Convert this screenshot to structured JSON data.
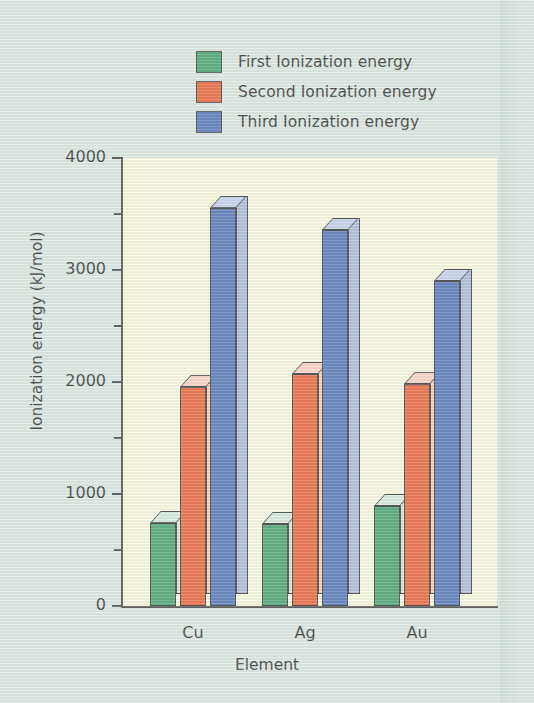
{
  "chart_data": {
    "type": "bar",
    "title": "",
    "xlabel": "Element",
    "ylabel": "Ionization energy (kJ/mol)",
    "categories": [
      "Cu",
      "Ag",
      "Au"
    ],
    "ylim": [
      0,
      4000
    ],
    "ytick_labels": [
      "0",
      "1000",
      "2000",
      "3000",
      "4000"
    ],
    "ytick_values": [
      0,
      1000,
      2000,
      3000,
      4000
    ],
    "yminor_ticks": [
      500,
      1500,
      2500,
      3500
    ],
    "grid": false,
    "legend_position": "top-center",
    "series": [
      {
        "name": "First Ionization energy",
        "color": "#3c9b66",
        "side_color": "#cfe4d4",
        "top_color": "#d4e8da",
        "values": [
          745,
          731,
          890
        ]
      },
      {
        "name": "Second Ionization energy",
        "color": "#e8592f",
        "side_color": "#f9c2ae",
        "top_color": "#fbcfbd",
        "values": [
          1958,
          2074,
          1980
        ]
      },
      {
        "name": "Third Ionization energy",
        "color": "#4a6cb3",
        "side_color": "#a5b3da",
        "top_color": "#c2cce9",
        "values": [
          3555,
          3361,
          2900
        ]
      }
    ]
  },
  "legend": {
    "items": [
      {
        "label": "First Ionization energy",
        "color": "#3c9b66"
      },
      {
        "label": "Second Ionization energy",
        "color": "#e8592f"
      },
      {
        "label": "Third Ionization energy",
        "color": "#4a6cb3"
      }
    ]
  },
  "axes": {
    "y_title": "Ionization energy (kJ/mol)",
    "x_title": "Element",
    "y_labels": [
      "4000",
      "3000",
      "2000",
      "1000",
      "0"
    ],
    "x_labels": [
      "Cu",
      "Ag",
      "Au"
    ]
  },
  "colors": {
    "page_background": "#dbe4df",
    "plot_background": "#faf7dd",
    "axis": "#3a3a3a",
    "text": "#1f1f1f"
  }
}
